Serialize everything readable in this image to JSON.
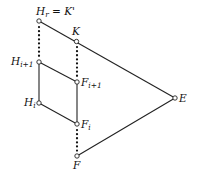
{
  "diagram": {
    "type": "lattice",
    "nodes": [
      {
        "id": "Hr",
        "label": "H",
        "sub": "r",
        "suffix": " = K'",
        "x": 39,
        "y": 21
      },
      {
        "id": "K",
        "label": "K",
        "sub": "",
        "suffix": "",
        "x": 76,
        "y": 41
      },
      {
        "id": "Hi1",
        "label": "H",
        "sub": "i+1",
        "suffix": "",
        "x": 39,
        "y": 62
      },
      {
        "id": "Fi1",
        "label": "F",
        "sub": "i+1",
        "suffix": "",
        "x": 77,
        "y": 82
      },
      {
        "id": "Hi",
        "label": "H",
        "sub": "i",
        "suffix": "",
        "x": 39,
        "y": 103
      },
      {
        "id": "Fi",
        "label": "F",
        "sub": "i",
        "suffix": "",
        "x": 77,
        "y": 124
      },
      {
        "id": "F",
        "label": "F",
        "sub": "",
        "suffix": "",
        "x": 77,
        "y": 156
      },
      {
        "id": "E",
        "label": "E",
        "sub": "",
        "suffix": "",
        "x": 175,
        "y": 98
      }
    ],
    "edges": [
      {
        "from": "Hr",
        "to": "E",
        "style": "solid"
      },
      {
        "from": "F",
        "to": "E",
        "style": "solid"
      },
      {
        "from": "Hi1",
        "to": "Fi1",
        "style": "solid"
      },
      {
        "from": "Hi",
        "to": "Fi",
        "style": "solid"
      },
      {
        "from": "Hi1",
        "to": "Hi",
        "style": "solid"
      },
      {
        "from": "Fi1",
        "to": "Fi",
        "style": "solid"
      },
      {
        "from": "Hr",
        "to": "Hi1",
        "style": "dotted"
      },
      {
        "from": "K",
        "to": "Fi1",
        "style": "dotted"
      },
      {
        "from": "Fi",
        "to": "F",
        "style": "dotted"
      }
    ],
    "labels": {
      "Hr": "H_r = K'",
      "K": "K",
      "Hi1": "H_{i+1}",
      "Fi1": "F_{i+1}",
      "Hi": "H_i",
      "Fi": "F_i",
      "F": "F",
      "E": "E"
    }
  }
}
